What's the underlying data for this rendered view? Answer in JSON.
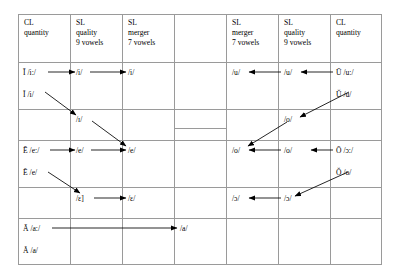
{
  "figure": {
    "type": "linguistic-vowel-development-table",
    "columns": [
      {
        "id": "cl-quantity-left",
        "lines": [
          "CL",
          "quantity"
        ]
      },
      {
        "id": "sl-quality-left",
        "lines": [
          "SL",
          "quality",
          "9 vowels"
        ]
      },
      {
        "id": "sl-merger-left",
        "lines": [
          "SL",
          "merger",
          "7 vowels"
        ]
      },
      {
        "id": "center-column",
        "lines": []
      },
      {
        "id": "sl-merger-right",
        "lines": [
          "SL",
          "merger",
          "7 vowels"
        ]
      },
      {
        "id": "sl-quality-right",
        "lines": [
          "SL",
          "quality",
          "9 vowels"
        ]
      },
      {
        "id": "cl-quantity-right",
        "lines": [
          "CL",
          "quantity"
        ]
      }
    ],
    "header": {
      "c1": "CL\nquantity",
      "c2": "SL\nquality\n9 vowels",
      "c3": "SL\nmerger\n7 vowels",
      "c4": "",
      "c5": "SL\nmerger\n7 vowels",
      "c6": "SL\nquality\n9 vowels",
      "c7": "CL\nquantity"
    },
    "front_series": {
      "r1_cl": "Ī /iː/",
      "r1_quality": "/i/",
      "r1_merger": "/i/",
      "r2_cl": "Ĭ /i/",
      "r3_quality": "/ɪ/",
      "r4_cl": "Ē /eː/",
      "r4_quality": "/e/",
      "r4_merger": "/e/",
      "r5_cl": "Ĕ /e/",
      "r6_quality": "/ɛ]",
      "r6_merger": "/ɛ/",
      "r7_cl": "Ā /aː/",
      "r8_cl": "Ă /a/"
    },
    "center_series": {
      "low_vowel": "/a/"
    },
    "back_series": {
      "r1_cl": "Ū /uː/",
      "r1_quality": "/u/",
      "r1_merger": "/u/",
      "r2_cl": "Ŭ /u/",
      "r3_quality": "/o/",
      "r4_cl": "Ō /ɔː/",
      "r4_quality": "/o/",
      "r4_merger": "/o/",
      "r5_cl": "Ŏ /o/",
      "r6_quality": "/ɔ/",
      "r6_merger": "/ɔ/"
    },
    "arrows": [
      {
        "id": "a1",
        "from": "Ī /iː/",
        "to": "/i/ (quality L)",
        "dir": "right"
      },
      {
        "id": "a2",
        "from": "/i/ (quality L)",
        "to": "/i/ (merger L)",
        "dir": "right"
      },
      {
        "id": "a3",
        "from": "Ĭ /i/",
        "to": "/ɪ/",
        "dir": "down-right"
      },
      {
        "id": "a4",
        "from": "/ɪ/",
        "to": "/e/ (merger L)",
        "dir": "down-right"
      },
      {
        "id": "a5",
        "from": "Ē /eː/",
        "to": "/e/ (quality L)",
        "dir": "right"
      },
      {
        "id": "a6",
        "from": "/e/ (quality L)",
        "to": "/e/ (merger L)",
        "dir": "right"
      },
      {
        "id": "a7",
        "from": "Ĕ /e/",
        "to": "/ɛ]",
        "dir": "down-right"
      },
      {
        "id": "a8",
        "from": "/ɛ]",
        "to": "/ɛ/ (merger L)",
        "dir": "right"
      },
      {
        "id": "a9",
        "from": "Ā /aː/",
        "to": "/a/ (center)",
        "dir": "right-long"
      },
      {
        "id": "a10",
        "from": "Ū /uː/",
        "to": "/u/ (quality R)",
        "dir": "left"
      },
      {
        "id": "a11",
        "from": "/u/ (quality R)",
        "to": "/u/ (merger R)",
        "dir": "left"
      },
      {
        "id": "a12",
        "from": "Ŭ /u/",
        "to": "/o/ (quality R upper)",
        "dir": "down-left"
      },
      {
        "id": "a13",
        "from": "/o/ (quality R upper)",
        "to": "/o/ (merger R)",
        "dir": "down-left"
      },
      {
        "id": "a14",
        "from": "Ō /ɔː/",
        "to": "/o/ (quality R)",
        "dir": "left"
      },
      {
        "id": "a15",
        "from": "/o/ (quality R)",
        "to": "/o/ (merger R)",
        "dir": "left"
      },
      {
        "id": "a16",
        "from": "Ŏ /o/",
        "to": "/ɔ/ (quality R)",
        "dir": "down-left"
      },
      {
        "id": "a17",
        "from": "/ɔ/ (quality R)",
        "to": "/ɔ/ (merger R)",
        "dir": "left"
      }
    ],
    "colors": {
      "grid": "#9a9a9a",
      "text": "#000000",
      "arrow": "#000000"
    }
  }
}
